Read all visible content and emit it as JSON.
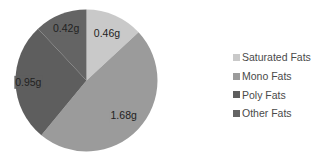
{
  "chart_data": {
    "type": "pie",
    "title": "",
    "unit": "g",
    "categories": [
      "Saturated Fats",
      "Mono Fats",
      "Poly Fats",
      "Other Fats"
    ],
    "values": [
      0.46,
      1.68,
      0.95,
      0.42
    ],
    "labels": [
      "0.46g",
      "1.68g",
      "0.95g",
      "0.42g"
    ],
    "colors": [
      "#c9c9c9",
      "#9b9b9b",
      "#5e5e5e",
      "#646464"
    ],
    "start_angle": "12 o'clock",
    "direction": "clockwise",
    "legend_position": "right"
  },
  "legend": {
    "items": [
      {
        "label": "Saturated Fats",
        "color": "#c9c9c9"
      },
      {
        "label": "Mono Fats",
        "color": "#9b9b9b"
      },
      {
        "label": "Poly Fats",
        "color": "#5e5e5e"
      },
      {
        "label": "Other Fats",
        "color": "#646464"
      }
    ]
  }
}
